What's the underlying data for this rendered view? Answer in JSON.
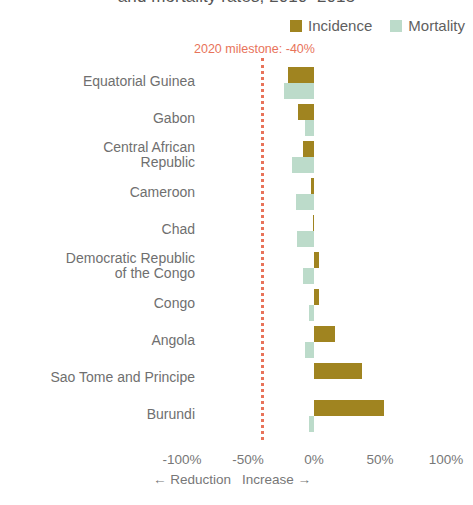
{
  "chart_data": {
    "type": "bar",
    "orientation": "horizontal",
    "title": "and mortality rates, 2010–2015",
    "xlabel": "",
    "ylabel": "",
    "xlim": [
      -100,
      100
    ],
    "xticks": [
      -100,
      -50,
      0,
      50,
      100
    ],
    "xtick_labels": [
      "-100%",
      "-50%",
      "0%",
      "50%",
      "100%"
    ],
    "grid": false,
    "legend_position": "top-right",
    "axis_captions": {
      "left": "← Reduction",
      "right": "Increase →"
    },
    "annotations": [
      {
        "name": "milestone",
        "text": "2020 milestone: -40%",
        "x": -40,
        "color": "#E8735A",
        "style": "dotted-vertical-line"
      }
    ],
    "categories": [
      "Equatorial Guinea",
      "Gabon",
      "Central African Republic",
      "Cameroon",
      "Chad",
      "Democratic Republic of the Congo",
      "Congo",
      "Angola",
      "Sao Tome and Principe",
      "Burundi"
    ],
    "category_lines": [
      [
        "Equatorial Guinea"
      ],
      [
        "Gabon"
      ],
      [
        "Central African",
        "Republic"
      ],
      [
        "Cameroon"
      ],
      [
        "Chad"
      ],
      [
        "Democratic Republic",
        "of the Congo"
      ],
      [
        "Congo"
      ],
      [
        "Angola"
      ],
      [
        "Sao Tome and Principe"
      ],
      [
        "Burundi"
      ]
    ],
    "series": [
      {
        "name": "Incidence",
        "color": "#A08420",
        "values": [
          -20,
          -12,
          -8,
          -2,
          -1,
          4,
          4,
          16,
          36,
          53
        ]
      },
      {
        "name": "Mortality",
        "color": "#BCDBCA",
        "values": [
          -23,
          -7,
          -17,
          -14,
          -13,
          -8,
          -4,
          -7,
          0,
          -4
        ]
      }
    ]
  },
  "colors": {
    "incidence": "#A08420",
    "mortality": "#BCDBCA",
    "milestone": "#E8735A",
    "text": "#6f6f6f",
    "background": "#ffffff"
  }
}
